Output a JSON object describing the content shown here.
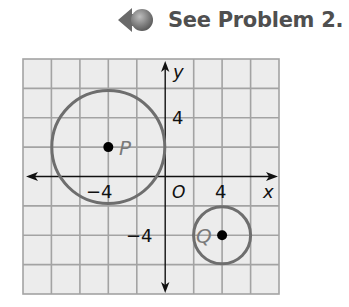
{
  "header": {
    "reference_text": "See Problem 2.",
    "icon": "back-arrow-ball-icon"
  },
  "colors": {
    "grid_background": "#ececec",
    "grid_line": "#a3a3a3",
    "circle_stroke": "#6e6e6e",
    "axis": "#111111",
    "header_text": "#4f4f4f",
    "point_label": "#7a7a7a"
  },
  "graph": {
    "x_axis_label": "x",
    "y_axis_label": "y",
    "origin_label": "O",
    "x_range": [
      -10,
      8
    ],
    "y_range": [
      -8,
      8
    ],
    "grid_step": 2,
    "tick_labels": {
      "x_neg": "−4",
      "x_pos": "4",
      "y_pos": "4",
      "y_neg": "−4"
    },
    "circles": [
      {
        "name": "P",
        "center": [
          -4,
          2
        ],
        "radius": 4
      },
      {
        "name": "Q",
        "center": [
          4,
          -4
        ],
        "radius": 2
      }
    ]
  },
  "labels": {
    "P": "P",
    "Q": "Q"
  }
}
